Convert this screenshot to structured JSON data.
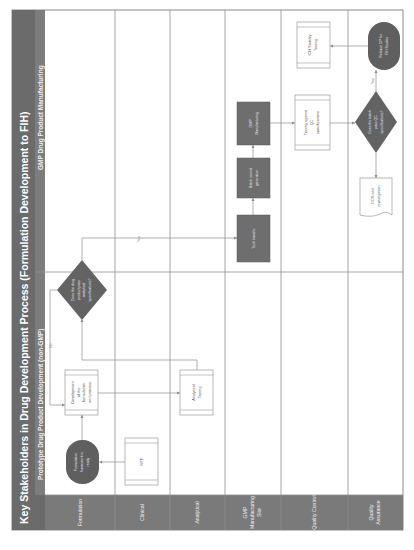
{
  "diagram": {
    "title": "Key Stakeholders in Drug Development Process (Formulation Development to FIH)",
    "phases": [
      {
        "label": "Prototype Drug Product Development (non-GMP)"
      },
      {
        "label": "GMP Drug Product Manufacturing"
      }
    ],
    "lanes": [
      {
        "label": "Formulation"
      },
      {
        "label": "Clinical"
      },
      {
        "label": "Analytical"
      },
      {
        "label_line1": "GMP",
        "label_line2": "Manufacturing",
        "label_line3": "Site"
      },
      {
        "label": "Quality Control"
      },
      {
        "label_line1": "Quality",
        "label_line2": "Assurance"
      }
    ],
    "nodes": {
      "formulation_ready": {
        "line1": "Formulation",
        "line2": "framework is",
        "line3": "ready"
      },
      "mtf": {
        "line1": "MTF"
      },
      "development": {
        "line1": "Development",
        "line2": "of the",
        "line3": "formulation",
        "line4": "and process"
      },
      "decision_meets_spec": {
        "line1": "Does the drug",
        "line2": "product pass",
        "line3": "analytical",
        "line4": "specifications?"
      },
      "analytical_testing": {
        "line1": "Analytical",
        "line2": "Testing"
      },
      "tech_transfer": {
        "line1": "Tech transfer"
      },
      "batch_record": {
        "line1": "Batch record",
        "line2": "generation"
      },
      "gmp_manufacturing": {
        "line1": "GMP",
        "line2": "Manufacturing"
      },
      "qc_testing": {
        "line1": "Testing against",
        "line2": "QC",
        "line3": "specifications"
      },
      "decision_qc_pass": {
        "line1": "Does the batch",
        "line2": "pass QC",
        "line3": "specifications?"
      },
      "oos_investigation": {
        "line1": "OOS and",
        "line2": "investigation"
      },
      "release_dp": {
        "line1": "Release DP for",
        "line2": "FIH Studies"
      },
      "ich_stability": {
        "line1": "ICH Stability",
        "line2": "Testing"
      }
    },
    "connector_labels": {
      "yes_1": "Yes",
      "no_1": "No",
      "yes_2": "Yes"
    }
  }
}
